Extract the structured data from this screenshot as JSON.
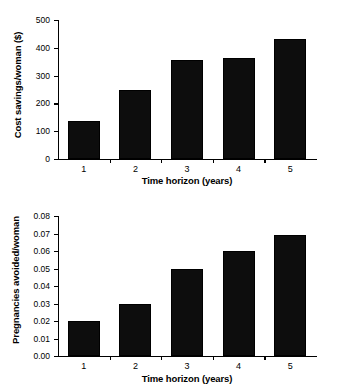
{
  "chart_data": [
    {
      "id": "cost-savings",
      "type": "bar",
      "title": "",
      "xlabel": "Time horizon (years)",
      "ylabel": "Cost savings/woman ($)",
      "categories": [
        "1",
        "2",
        "3",
        "4",
        "5"
      ],
      "values": [
        135,
        250,
        355,
        365,
        430
      ],
      "ylim": [
        0,
        500
      ],
      "yticks": [
        0,
        100,
        200,
        300,
        400,
        500
      ],
      "ytick_labels": [
        "0",
        "100",
        "200",
        "300",
        "400",
        "500"
      ],
      "grid": false,
      "legend": "none",
      "bar_color": "#0d0d0d"
    },
    {
      "id": "pregnancies-avoided",
      "type": "bar",
      "title": "",
      "xlabel": "Time horizon (years)",
      "ylabel": "Pregnancies avoided/woman",
      "categories": [
        "1",
        "2",
        "3",
        "4",
        "5"
      ],
      "values": [
        0.02,
        0.03,
        0.05,
        0.06,
        0.069
      ],
      "ylim": [
        0.0,
        0.08
      ],
      "yticks": [
        0.0,
        0.01,
        0.02,
        0.03,
        0.04,
        0.05,
        0.06,
        0.07,
        0.08
      ],
      "ytick_labels": [
        "0.00",
        "0.01",
        "0.02",
        "0.03",
        "0.04",
        "0.05",
        "0.06",
        "0.07",
        "0.08"
      ],
      "grid": false,
      "legend": "none",
      "bar_color": "#0d0d0d"
    }
  ]
}
